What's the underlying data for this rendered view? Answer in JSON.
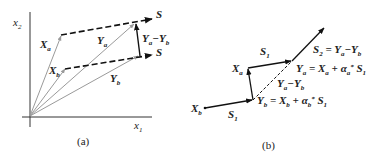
{
  "panel_a": {
    "caption": "(a)",
    "x_axis_label": "x",
    "x_axis_sub": "1",
    "y_axis_label": "x",
    "y_axis_sub": "2",
    "labels": {
      "Xa": {
        "base": "X",
        "sub": "a"
      },
      "Xb": {
        "base": "X",
        "sub": "b"
      },
      "Ya": {
        "base": "Y",
        "sub": "a"
      },
      "Yb": {
        "base": "Y",
        "sub": "b"
      },
      "diff": {
        "base1": "Y",
        "sub1": "a",
        "minus": "−",
        "base2": "Y",
        "sub2": "b"
      },
      "S_top": "S",
      "S_bottom": "S"
    },
    "colors": {
      "gray_vector": "#9a9a9a",
      "black": "#111111"
    }
  },
  "panel_b": {
    "caption": "(b)",
    "labels": {
      "Xb": {
        "base": "X",
        "sub": "b"
      },
      "Xa": {
        "base": "X",
        "sub": "a"
      },
      "S1_bottom": {
        "base": "S",
        "sub": "1"
      },
      "S1_top": {
        "base": "S",
        "sub": "1"
      },
      "diff": {
        "base1": "Y",
        "sub1": "a",
        "minus": "−",
        "base2": "Y",
        "sub2": "b"
      },
      "Ya_eq": {
        "lhs": "Y",
        "lhs_sub": "a",
        "eq": " = ",
        "x": "X",
        "x_sub": "a",
        "plus": " + α",
        "alpha_sub": "a",
        "alpha_sup": "*",
        "s": " S",
        "s_sub": "1"
      },
      "Yb_eq": {
        "lhs": "Y",
        "lhs_sub": "b",
        "eq": " = ",
        "x": "X",
        "x_sub": "b",
        "plus": " + α",
        "alpha_sub": "b",
        "alpha_sup": "*",
        "s": " S",
        "s_sub": "1"
      },
      "S2_eq": {
        "lhs": "S",
        "lhs_sub": "2",
        "eq": " = ",
        "y1": "Y",
        "y1_sub": "a",
        "minus": "−",
        "y2": "Y",
        "y2_sub": "b"
      }
    }
  }
}
